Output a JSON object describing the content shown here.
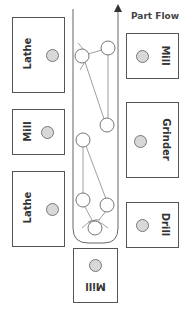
{
  "diagram": {
    "flow_label": "Part Flow",
    "machines": [
      {
        "id": "lathe-1",
        "label": "Lathe",
        "side": "left"
      },
      {
        "id": "mill-1",
        "label": "Mill",
        "side": "left"
      },
      {
        "id": "lathe-2",
        "label": "Lathe",
        "side": "left"
      },
      {
        "id": "mill-2",
        "label": "Mill",
        "side": "right"
      },
      {
        "id": "grinder",
        "label": "Grinder",
        "side": "right"
      },
      {
        "id": "drill",
        "label": "Drill",
        "side": "right"
      },
      {
        "id": "mill-3",
        "label": "Mill",
        "side": "bottom"
      }
    ],
    "colors": {
      "outline": "#555555",
      "station_dot": "#d8d8d8",
      "path": "#777777"
    }
  }
}
